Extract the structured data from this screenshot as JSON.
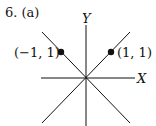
{
  "problem": {
    "number": "6.",
    "part": "(a)"
  },
  "axes": {
    "x_label": "X",
    "y_label": "Y"
  },
  "lines": [
    {
      "name": "y = x",
      "from": [
        42,
        123
      ],
      "to": [
        130,
        32
      ]
    },
    {
      "name": "y = -x",
      "from": [
        42,
        32
      ],
      "to": [
        130,
        123
      ]
    }
  ],
  "points": [
    {
      "label": "(−1, 1)",
      "x": 61,
      "y": 52
    },
    {
      "label": "(1, 1)",
      "x": 111,
      "y": 52
    }
  ],
  "colors": {
    "ink": "#111111",
    "background": "#ffffff"
  }
}
